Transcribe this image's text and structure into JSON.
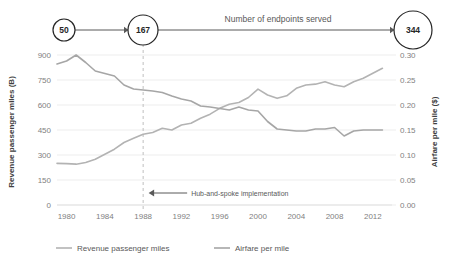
{
  "flow": {
    "label": "Number of endpoints served",
    "nodes": [
      {
        "value": "50",
        "r": 11,
        "cx": 64,
        "cy": 30
      },
      {
        "value": "167",
        "r": 15,
        "cx": 143,
        "cy": 30
      },
      {
        "value": "344",
        "r": 19,
        "cx": 413,
        "cy": 30
      }
    ]
  },
  "annotation": {
    "text": "Hub-and-spoke implementation",
    "at_year": 1988
  },
  "legend": {
    "items": [
      {
        "label": "Revenue passenger miles",
        "color": "#b3b3b3"
      },
      {
        "label": "Airfare per mile",
        "color": "#a6a6a6"
      }
    ]
  },
  "chart_data": {
    "type": "line",
    "title": "",
    "xlabel": "",
    "ylabel": "Revenue passenger miles (B)",
    "y2label": "Airfare per mile ($)",
    "xlim": [
      1979,
      2014
    ],
    "ylim": [
      0,
      900
    ],
    "y2lim": [
      0.0,
      0.3
    ],
    "xticks": [
      1980,
      1984,
      1988,
      1992,
      1996,
      2000,
      2004,
      2008,
      2012
    ],
    "yticks": [
      0,
      150,
      300,
      450,
      600,
      750,
      900
    ],
    "y2ticks": [
      "0.00",
      "0.05",
      "0.10",
      "0.15",
      "0.20",
      "0.25",
      "0.30"
    ],
    "grid": true,
    "legend_position": "bottom",
    "x": [
      1979,
      1980,
      1981,
      1982,
      1983,
      1984,
      1985,
      1986,
      1987,
      1988,
      1989,
      1990,
      1991,
      1992,
      1993,
      1994,
      1995,
      1996,
      1997,
      1998,
      1999,
      2000,
      2001,
      2002,
      2003,
      2004,
      2005,
      2006,
      2007,
      2008,
      2009,
      2010,
      2011,
      2012,
      2013
    ],
    "series": [
      {
        "name": "Revenue passenger miles",
        "axis": "left",
        "color": "#b3b3b3",
        "units": "B",
        "values": [
          250,
          248,
          245,
          255,
          275,
          305,
          335,
          375,
          400,
          425,
          435,
          460,
          450,
          480,
          490,
          520,
          545,
          580,
          605,
          615,
          645,
          695,
          660,
          640,
          655,
          700,
          720,
          725,
          740,
          720,
          710,
          740,
          760,
          790,
          820
        ]
      },
      {
        "name": "Airfare per mile",
        "axis": "right",
        "color": "#a6a6a6",
        "units": "$",
        "values": [
          0.282,
          0.288,
          0.3,
          0.285,
          0.268,
          0.263,
          0.258,
          0.24,
          0.232,
          0.23,
          0.228,
          0.225,
          0.218,
          0.212,
          0.208,
          0.198,
          0.196,
          0.193,
          0.19,
          0.196,
          0.19,
          0.188,
          0.167,
          0.152,
          0.15,
          0.148,
          0.148,
          0.152,
          0.152,
          0.155,
          0.138,
          0.148,
          0.15,
          0.15,
          0.15
        ]
      }
    ]
  }
}
